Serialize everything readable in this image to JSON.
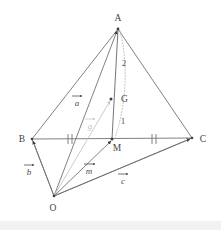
{
  "figure": {
    "kind": "geometry-diagram",
    "background_color": "#ffffff",
    "line_color": "#6f7376",
    "pale_vector_color": "#c2c6c9",
    "dotted_color": "#b0b4b7",
    "vertices": [
      {
        "name": "A",
        "label": "A",
        "x": 118,
        "y": 29,
        "label_x": 118,
        "label_y": 21
      },
      {
        "name": "B",
        "label": "B",
        "x": 32,
        "y": 139,
        "label_x": 22,
        "label_y": 141
      },
      {
        "name": "C",
        "label": "C",
        "x": 192,
        "y": 138,
        "label_x": 202,
        "label_y": 141
      },
      {
        "name": "O",
        "label": "O",
        "x": 54,
        "y": 196,
        "label_x": 53,
        "label_y": 210
      },
      {
        "name": "M",
        "label": "M",
        "x": 112,
        "y": 139,
        "label_x": 116,
        "label_y": 150
      },
      {
        "name": "G",
        "label": "G",
        "x": 111,
        "y": 99,
        "label_x": 119,
        "label_y": 99
      }
    ],
    "ratio_labels": [
      {
        "name": "segment-ratio-AG",
        "text": "2",
        "x": 124,
        "y": 63
      },
      {
        "name": "segment-ratio-GM",
        "text": "1",
        "x": 123,
        "y": 121
      }
    ],
    "vector_labels": [
      {
        "name": "vector-a",
        "text": "a",
        "x": 76,
        "y": 105,
        "bar_x1": 71,
        "bar_x2": 82,
        "bar_y": 96,
        "pale": false
      },
      {
        "name": "vector-g",
        "text": "g",
        "x": 88,
        "y": 128,
        "bar_x1": 84,
        "bar_x2": 95,
        "bar_y": 119,
        "pale": true
      },
      {
        "name": "vector-b",
        "text": "b",
        "x": 27,
        "y": 174,
        "bar_x1": 23,
        "bar_x2": 34,
        "bar_y": 165,
        "pale": false
      },
      {
        "name": "vector-m",
        "text": "m",
        "x": 86,
        "y": 173,
        "bar_x1": 83,
        "bar_x2": 95,
        "bar_y": 164,
        "pale": false
      },
      {
        "name": "vector-c",
        "text": "c",
        "x": 121,
        "y": 183,
        "bar_x1": 117,
        "bar_x2": 128,
        "bar_y": 174,
        "pale": false
      }
    ],
    "tick_marks": [
      {
        "name": "tick-mark-BM",
        "x": 70,
        "y": 139
      },
      {
        "name": "tick-mark-MC",
        "x": 154,
        "y": 139
      }
    ],
    "edges": [
      {
        "name": "edge-A-B",
        "from": "A",
        "to": "B"
      },
      {
        "name": "edge-A-C",
        "from": "A",
        "to": "C"
      },
      {
        "name": "edge-A-O",
        "from": "A",
        "to": "O"
      },
      {
        "name": "edge-B-C",
        "from": "B",
        "to": "C"
      },
      {
        "name": "edge-B-O",
        "from": "B",
        "to": "O"
      },
      {
        "name": "edge-C-O",
        "from": "C",
        "to": "O"
      },
      {
        "name": "edge-A-M",
        "from": "A",
        "to": "M"
      },
      {
        "name": "edge-O-M",
        "from": "O",
        "to": "M"
      },
      {
        "name": "edge-O-G",
        "from": "O",
        "to": "G"
      }
    ]
  }
}
